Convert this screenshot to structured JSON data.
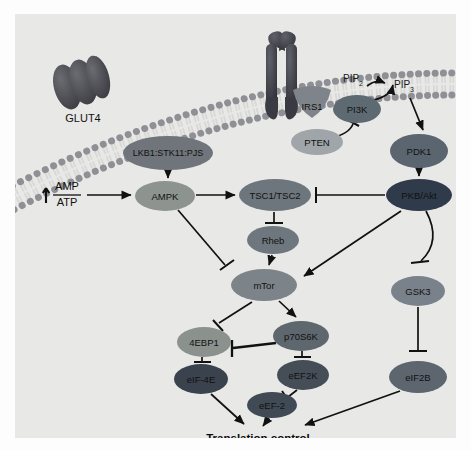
{
  "figure": {
    "kind": "signaling-pathway-diagram",
    "background_color": "#e8e8e6",
    "outer_background": "#fdfdfd"
  },
  "membrane": {
    "name": "plasma-membrane",
    "head_color": "#8f9095",
    "tail_color": "#d8d8d6",
    "description": "curved phospholipid bilayer across the top"
  },
  "transporters": [
    {
      "id": "glut4",
      "label": "GLUT4",
      "color": "#4a4a50",
      "cx": 68,
      "cy": 70,
      "label_x": 68,
      "label_y": 118
    },
    {
      "id": "insulin-receptor",
      "label": "",
      "color": "#3f4046",
      "cx": 265,
      "cy": 52
    }
  ],
  "lipid_labels": [
    {
      "id": "pip2",
      "base": "PIP",
      "sub": "2",
      "x": 338,
      "y": 68,
      "color": "#1a1a1a"
    },
    {
      "id": "pip3",
      "base": "PIP",
      "sub": "3",
      "x": 389,
      "y": 74,
      "color": "#1a1a1a"
    }
  ],
  "ratio_label": {
    "id": "amp-atp-ratio",
    "numerator": "AMP",
    "denominator": "ATP",
    "arrow": "up",
    "x": 48,
    "y": 181
  },
  "output_label": {
    "id": "translation-control",
    "text": "Translation control",
    "x": 243,
    "y": 428,
    "bold": true
  },
  "nodes": [
    {
      "id": "irs1",
      "label": "IRS1",
      "cx": 297,
      "cy": 89,
      "rx": 19,
      "ry": 15,
      "color": "#7e8489",
      "shape": "blob-irs1",
      "text_color": "#101010",
      "font_size": 9.5
    },
    {
      "id": "pi3k",
      "label": "PI3K",
      "cx": 342,
      "cy": 95,
      "rx": 24,
      "ry": 14,
      "color": "#5d6a72",
      "shape": "ellipse",
      "text_color": "#111111",
      "font_size": 9.5
    },
    {
      "id": "pten",
      "label": "PTEN",
      "cx": 302,
      "cy": 128,
      "rx": 26,
      "ry": 13,
      "color": "#9fa5a8",
      "shape": "ellipse",
      "text_color": "#101010",
      "font_size": 9.5
    },
    {
      "id": "pdk1",
      "label": "PDK1",
      "cx": 404,
      "cy": 137,
      "rx": 29,
      "ry": 17,
      "color": "#5a6570",
      "shape": "ellipse",
      "text_color": "#0e0e0e",
      "font_size": 9.5
    },
    {
      "id": "pkbakt",
      "label": "PKB/Akt",
      "cx": 404,
      "cy": 181,
      "rx": 33,
      "ry": 16,
      "color": "#2f3a4a",
      "shape": "ellipse",
      "text_color": "#e9e9e9",
      "font_size": 9.5
    },
    {
      "id": "lkb1",
      "label": "LKB1:STK11:PJS",
      "cx": 153,
      "cy": 139,
      "rx": 45,
      "ry": 17,
      "color": "#6f757a",
      "shape": "ellipse",
      "text_color": "#0d0d0d",
      "font_size": 9
    },
    {
      "id": "ampk",
      "label": "AMPK",
      "cx": 150,
      "cy": 182,
      "rx": 30,
      "ry": 15,
      "color": "#8d938f",
      "shape": "ellipse",
      "text_color": "#101010",
      "font_size": 9.5
    },
    {
      "id": "tsc",
      "label": "TSC1/TSC2",
      "cx": 260,
      "cy": 181,
      "rx": 36,
      "ry": 16,
      "color": "#6d767c",
      "shape": "ellipse",
      "text_color": "#0e0e0e",
      "font_size": 9.5
    },
    {
      "id": "rheb",
      "label": "Rheb",
      "cx": 258,
      "cy": 226,
      "rx": 26,
      "ry": 14,
      "color": "#6e777e",
      "shape": "ellipse",
      "text_color": "#0f0f0f",
      "font_size": 9.5
    },
    {
      "id": "mtor",
      "label": "mTor",
      "cx": 249,
      "cy": 271,
      "rx": 33,
      "ry": 16,
      "color": "#7d8489",
      "shape": "ellipse",
      "text_color": "#0e0e0e",
      "font_size": 9.5
    },
    {
      "id": "4ebp1",
      "label": "4EBP1",
      "cx": 189,
      "cy": 328,
      "rx": 27,
      "ry": 15,
      "color": "#8b918d",
      "shape": "ellipse",
      "text_color": "#101010",
      "font_size": 9.5
    },
    {
      "id": "p70s6k",
      "label": "p70S6K",
      "cx": 286,
      "cy": 322,
      "rx": 28,
      "ry": 15,
      "color": "#5e676e",
      "shape": "ellipse",
      "text_color": "#141414",
      "font_size": 9.5
    },
    {
      "id": "eif4e",
      "label": "eIF-4E",
      "cx": 186,
      "cy": 365,
      "rx": 27,
      "ry": 15,
      "color": "#39424d",
      "shape": "ellipse",
      "text_color": "#e8e8e8",
      "font_size": 9.5
    },
    {
      "id": "eef2k",
      "label": "eEF2K",
      "cx": 288,
      "cy": 361,
      "rx": 26,
      "ry": 15,
      "color": "#454e57",
      "shape": "ellipse",
      "text_color": "#e6e6e6",
      "font_size": 9.5
    },
    {
      "id": "eef2",
      "label": "eEF-2",
      "cx": 257,
      "cy": 391,
      "rx": 25,
      "ry": 13,
      "color": "#404a54",
      "shape": "ellipse",
      "text_color": "#e8e8e8",
      "font_size": 9.5
    },
    {
      "id": "gsk3",
      "label": "GSK3",
      "cx": 403,
      "cy": 277,
      "rx": 27,
      "ry": 15,
      "color": "#79818a",
      "shape": "ellipse",
      "text_color": "#0f0f0f",
      "font_size": 9.5
    },
    {
      "id": "eif2b",
      "label": "eIF2B",
      "cx": 403,
      "cy": 363,
      "rx": 29,
      "ry": 16,
      "color": "#5d666e",
      "shape": "ellipse",
      "text_color": "#f0f0f0",
      "font_size": 9.5
    }
  ],
  "edges": [
    {
      "id": "ampratio-to-ampk",
      "from": "amp-atp-ratio",
      "to": "ampk",
      "type": "activation"
    },
    {
      "id": "lkb1-to-ampk",
      "from": "lkb1",
      "to": "ampk",
      "type": "activation"
    },
    {
      "id": "ampk-to-tsc",
      "from": "ampk",
      "to": "tsc",
      "type": "activation"
    },
    {
      "id": "ampk-to-mtor",
      "from": "ampk",
      "to": "mtor",
      "type": "inhibition"
    },
    {
      "id": "pkbakt-to-tsc",
      "from": "pkbakt",
      "to": "tsc",
      "type": "inhibition"
    },
    {
      "id": "tsc-to-rheb",
      "from": "tsc",
      "to": "rheb",
      "type": "inhibition"
    },
    {
      "id": "rheb-to-mtor",
      "from": "rheb",
      "to": "mtor",
      "type": "activation"
    },
    {
      "id": "pkbakt-to-mtor",
      "from": "pkbakt",
      "to": "mtor",
      "type": "activation"
    },
    {
      "id": "pdk1-to-pkbakt",
      "from": "pdk1",
      "to": "pkbakt",
      "type": "activation"
    },
    {
      "id": "pip3-to-pdk1",
      "from": "pip3",
      "to": "pdk1",
      "type": "activation"
    },
    {
      "id": "pi3k-to-pip3",
      "from": "pi3k",
      "to": "pip3",
      "type": "activation"
    },
    {
      "id": "pip2-to-pip3",
      "from": "pip2",
      "to": "pip3",
      "type": "activation"
    },
    {
      "id": "pten-to-pi3k",
      "from": "pten",
      "to": "pi3k",
      "type": "inhibition"
    },
    {
      "id": "pkbakt-to-gsk3",
      "from": "pkbakt",
      "to": "gsk3",
      "type": "inhibition"
    },
    {
      "id": "gsk3-to-eif2b",
      "from": "gsk3",
      "to": "eif2b",
      "type": "inhibition"
    },
    {
      "id": "mtor-to-4ebp1",
      "from": "mtor",
      "to": "4ebp1",
      "type": "inhibition"
    },
    {
      "id": "mtor-to-p70s6k",
      "from": "mtor",
      "to": "p70s6k",
      "type": "activation"
    },
    {
      "id": "p70s6k-to-4ebp1",
      "from": "p70s6k",
      "to": "4ebp1",
      "type": "inhibition"
    },
    {
      "id": "4ebp1-to-eif4e",
      "from": "4ebp1",
      "to": "eif4e",
      "type": "inhibition"
    },
    {
      "id": "p70s6k-to-eef2k",
      "from": "p70s6k",
      "to": "eef2k",
      "type": "inhibition"
    },
    {
      "id": "eef2k-to-eef2",
      "from": "eef2k",
      "to": "eef2",
      "type": "inhibition"
    },
    {
      "id": "eif4e-to-output",
      "from": "eif4e",
      "to": "translation-control",
      "type": "activation"
    },
    {
      "id": "eef2-to-output",
      "from": "eef2",
      "to": "translation-control",
      "type": "activation"
    },
    {
      "id": "eif2b-to-output",
      "from": "eif2b",
      "to": "translation-control",
      "type": "activation"
    }
  ]
}
